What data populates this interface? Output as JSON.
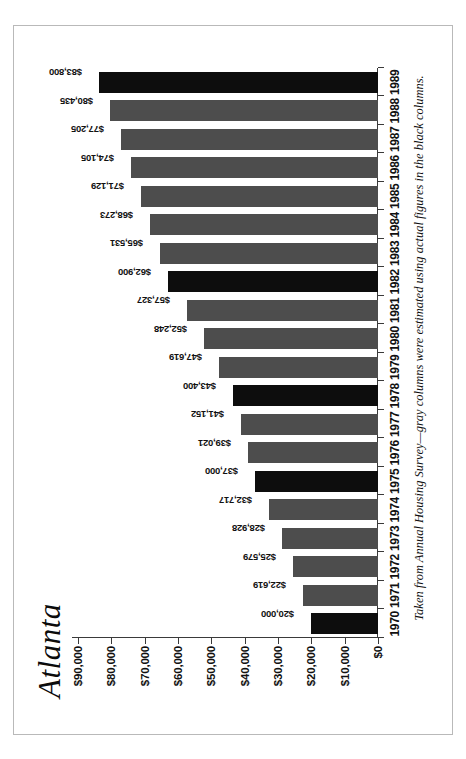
{
  "document": {
    "orientation": "rotated-90-counterclockwise",
    "background_color": "#ffffff",
    "frame_color": "#b9b9b9"
  },
  "chart": {
    "title": "Atlanta",
    "footnote": "Taken from Annual Housing Survey—gray columns were estimated using actual figures in the black columns.",
    "colors": {
      "actual": "#0d0d0d",
      "estimate": "#4d4d4d",
      "axis": "#3a3a3a",
      "text": "#111111"
    },
    "legend_note": {
      "actual_label": "black columns",
      "estimate_label": "gray columns"
    }
  },
  "chart_data": {
    "type": "bar",
    "title": "Atlanta",
    "xlabel": "",
    "ylabel": "",
    "ylim": [
      0,
      90000
    ],
    "grid": false,
    "orientation": "vertical",
    "categories": [
      "1970",
      "1971",
      "1972",
      "1973",
      "1974",
      "1975",
      "1976",
      "1977",
      "1978",
      "1979",
      "1980",
      "1981",
      "1982",
      "1983",
      "1984",
      "1985",
      "1986",
      "1987",
      "1988",
      "1989"
    ],
    "values": [
      20000,
      22619,
      25579,
      28928,
      32717,
      37000,
      39021,
      41152,
      43400,
      47619,
      52248,
      57327,
      62900,
      65531,
      68273,
      71129,
      74105,
      77205,
      80435,
      83800
    ],
    "value_labels": [
      "$20,000",
      "$22,619",
      "$25,579",
      "$28,928",
      "$32,717",
      "$37,000",
      "$39,021",
      "$41,152",
      "$43,400",
      "$47,619",
      "$52,248",
      "$57,327",
      "$62,900",
      "$65,531",
      "$68,273",
      "$71,129",
      "$74,105",
      "$77,205",
      "$80,435",
      "$83,800"
    ],
    "bar_kinds": [
      "actual",
      "estimate",
      "estimate",
      "estimate",
      "estimate",
      "actual",
      "estimate",
      "estimate",
      "actual",
      "estimate",
      "estimate",
      "estimate",
      "actual",
      "estimate",
      "estimate",
      "estimate",
      "estimate",
      "estimate",
      "estimate",
      "actual"
    ],
    "y_ticks": [
      0,
      10000,
      20000,
      30000,
      40000,
      50000,
      60000,
      70000,
      80000,
      90000
    ],
    "y_tick_labels": [
      "$0",
      "$10,000",
      "$20,000",
      "$30,000",
      "$40,000",
      "$50,000",
      "$60,000",
      "$70,000",
      "$80,000",
      "$90,000"
    ]
  }
}
